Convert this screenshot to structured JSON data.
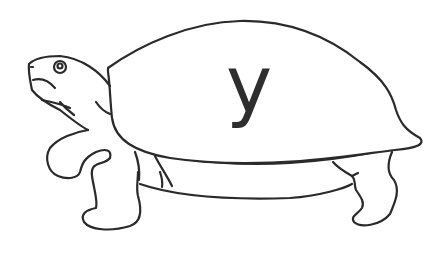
{
  "illustration": {
    "subject": "turtle",
    "style": "black line drawing on white",
    "shell_letter": "y",
    "colors": {
      "background": "#ffffff",
      "stroke": "#2a2a2a",
      "letter": "#2e2e2e"
    }
  }
}
